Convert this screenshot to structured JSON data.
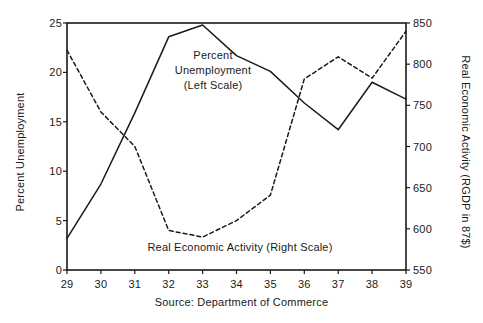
{
  "chart_data": {
    "type": "line",
    "title": "",
    "subtitle": "",
    "xlabel": "",
    "source_note": "Source: Department of Commerce",
    "grid": false,
    "legend_position": "inline-annotations",
    "x": [
      29,
      30,
      31,
      32,
      33,
      34,
      35,
      36,
      37,
      38,
      39
    ],
    "x_tick_labels": [
      "29",
      "30",
      "31",
      "32",
      "33",
      "34",
      "35",
      "36",
      "37",
      "38",
      "39"
    ],
    "xlim": [
      29,
      39
    ],
    "axes": {
      "left": {
        "label": "Percent Unemployment",
        "ylim": [
          0,
          25
        ],
        "ticks": [
          0,
          5,
          10,
          15,
          20,
          25
        ],
        "tick_labels": [
          "0",
          "5",
          "10",
          "15",
          "20",
          "25"
        ]
      },
      "right": {
        "label": "Real Economic Activity (RGDP in 87$)",
        "ylim": [
          550,
          850
        ],
        "ticks": [
          550,
          600,
          650,
          700,
          750,
          800,
          850
        ],
        "tick_labels": [
          "550",
          "600",
          "650",
          "700",
          "750",
          "800",
          "850"
        ]
      }
    },
    "series": [
      {
        "name": "Percent Unemployment (Left Scale)",
        "axis": "left",
        "style": "solid",
        "color": "#1a1a1a",
        "values": [
          3.2,
          8.7,
          15.9,
          23.6,
          24.8,
          21.7,
          20.1,
          16.9,
          14.2,
          19.0,
          17.3
        ]
      },
      {
        "name": "Real Economic Activity (Right Scale)",
        "axis": "right",
        "style": "dashed",
        "color": "#1a1a1a",
        "values": [
          817,
          742,
          700,
          598,
          590,
          610,
          641,
          782,
          809,
          783,
          840
        ]
      }
    ],
    "annotations": [
      {
        "name": "unemployment-label",
        "lines": [
          "Percent",
          "Unemployment",
          "(Left Scale)"
        ]
      },
      {
        "name": "rgdp-label",
        "lines": [
          "Real Economic Activity (Right Scale)"
        ]
      }
    ]
  }
}
